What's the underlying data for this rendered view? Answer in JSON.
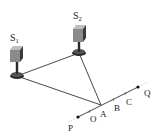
{
  "diagram": {
    "type": "two-source interference setup",
    "sources": [
      {
        "id": "S1",
        "label": "S",
        "subscript": "1"
      },
      {
        "id": "S2",
        "label": "S",
        "subscript": "2"
      }
    ],
    "line": {
      "endpoints": [
        "P",
        "Q"
      ],
      "points": [
        "O",
        "A",
        "B",
        "C"
      ]
    },
    "labels": {
      "P": "P",
      "O": "O",
      "A": "A",
      "B": "B",
      "C": "C",
      "Q": "Q"
    },
    "connections": [
      {
        "from": "S1",
        "to": "S2"
      },
      {
        "from": "S1",
        "to": "A"
      },
      {
        "from": "S2",
        "to": "A"
      }
    ],
    "colors": {
      "line": "#333333",
      "speaker_body": "#8a8a8a",
      "speaker_side": "#3a3a3a",
      "base": "#2a2a2a"
    }
  }
}
